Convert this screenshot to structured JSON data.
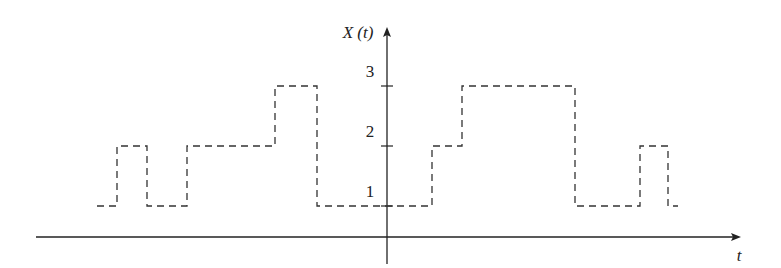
{
  "chart_data": {
    "type": "line",
    "subtype": "step",
    "title": "",
    "xlabel": "t",
    "ylabel": "X (t)",
    "y_ticks": [
      1,
      2,
      3
    ],
    "ylim": [
      0,
      3.5
    ],
    "grid": false,
    "legend": null,
    "line_style": "dashed",
    "series": [
      {
        "name": "X(t)",
        "steps": [
          {
            "t_start": -4.8,
            "t_end": -4.5,
            "value": 1
          },
          {
            "t_start": -4.5,
            "t_end": -4.0,
            "value": 2
          },
          {
            "t_start": -4.0,
            "t_end": -3.4,
            "value": 1
          },
          {
            "t_start": -3.4,
            "t_end": -1.9,
            "value": 2
          },
          {
            "t_start": -1.9,
            "t_end": -1.2,
            "value": 3
          },
          {
            "t_start": -1.2,
            "t_end": 0.75,
            "value": 1
          },
          {
            "t_start": 0.75,
            "t_end": 1.25,
            "value": 2
          },
          {
            "t_start": 1.25,
            "t_end": 3.1,
            "value": 3
          },
          {
            "t_start": 3.1,
            "t_end": 4.2,
            "value": 1
          },
          {
            "t_start": 4.2,
            "t_end": 4.7,
            "value": 2
          },
          {
            "t_start": 4.7,
            "t_end": 4.85,
            "value": 1
          }
        ]
      }
    ],
    "pixel_map": {
      "x_axis_y": 237,
      "y_axis_x": 387,
      "level_y": {
        "1": 206,
        "2": 146,
        "3": 86
      },
      "step_x": [
        97,
        117,
        147,
        187,
        275,
        317,
        432,
        462,
        575,
        640,
        668,
        678
      ],
      "step_levels": [
        1,
        2,
        1,
        2,
        3,
        1,
        2,
        3,
        1,
        2,
        1
      ]
    }
  },
  "labels": {
    "y_axis": "X (t)",
    "x_axis": "t",
    "tick_1": "1",
    "tick_2": "2",
    "tick_3": "3"
  }
}
